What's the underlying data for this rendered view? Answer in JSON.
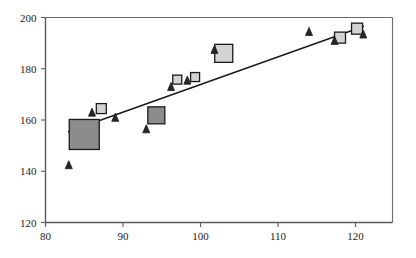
{
  "chart_data": {
    "type": "scatter",
    "title": "",
    "subtitle": "",
    "xlabel": "",
    "ylabel": "",
    "xlim": [
      80,
      126
    ],
    "ylim": [
      120,
      200
    ],
    "xticks": [
      80,
      90,
      100,
      110,
      120
    ],
    "yticks": [
      120,
      140,
      160,
      180,
      200
    ],
    "xtick_labels": [
      "80",
      "90",
      "100",
      "110",
      "120"
    ],
    "ytick_labels": [
      "120",
      "140",
      "160",
      "180",
      "200"
    ],
    "grid": false,
    "legend": null,
    "frame": "box",
    "colors": {
      "axis": "#595959",
      "frame": "#6b6b6b",
      "trendline": "#1a1a1a",
      "triangle_fill": "#262626",
      "square_fill": "#8c8c8c",
      "square_light_fill": "#d4d4d4",
      "marker_edge": "#1a1a1a",
      "background": "#ffffff",
      "text": "#1a1a1a"
    },
    "series": [
      {
        "name": "triangles",
        "marker": "triangle",
        "fill": "#262626",
        "points": [
          {
            "x": 83.0,
            "y": 141.0,
            "size": 7
          },
          {
            "x": 86.0,
            "y": 161.5,
            "size": 7
          },
          {
            "x": 89.0,
            "y": 159.5,
            "size": 7
          },
          {
            "x": 93.0,
            "y": 155.0,
            "size": 7
          },
          {
            "x": 96.2,
            "y": 171.5,
            "size": 7
          },
          {
            "x": 98.3,
            "y": 174.0,
            "size": 7
          },
          {
            "x": 101.8,
            "y": 186.0,
            "size": 7
          },
          {
            "x": 114.0,
            "y": 193.0,
            "size": 7
          },
          {
            "x": 117.3,
            "y": 189.5,
            "size": 7
          },
          {
            "x": 121.0,
            "y": 192.0,
            "size": 7
          }
        ]
      },
      {
        "name": "squares",
        "marker": "square",
        "fill": "#8c8c8c",
        "points": [
          {
            "x": 85.0,
            "y": 148.5,
            "size": 30,
            "shade": "dark"
          },
          {
            "x": 87.2,
            "y": 162.5,
            "size": 10,
            "shade": "light"
          },
          {
            "x": 94.3,
            "y": 158.5,
            "size": 17,
            "shade": "dark"
          },
          {
            "x": 97.0,
            "y": 174.0,
            "size": 9,
            "shade": "light"
          },
          {
            "x": 99.3,
            "y": 175.0,
            "size": 9,
            "shade": "light"
          },
          {
            "x": 103.0,
            "y": 182.5,
            "size": 18,
            "shade": "light"
          },
          {
            "x": 118.0,
            "y": 190.0,
            "size": 11,
            "shade": "light"
          },
          {
            "x": 120.2,
            "y": 193.5,
            "size": 11,
            "shade": "light"
          }
        ]
      }
    ],
    "trendline": {
      "name": "linear-fit",
      "x0": 83.0,
      "y0": 155.5,
      "x1": 121.0,
      "y1": 196.5,
      "color": "#1a1a1a",
      "width": 1.4
    }
  }
}
